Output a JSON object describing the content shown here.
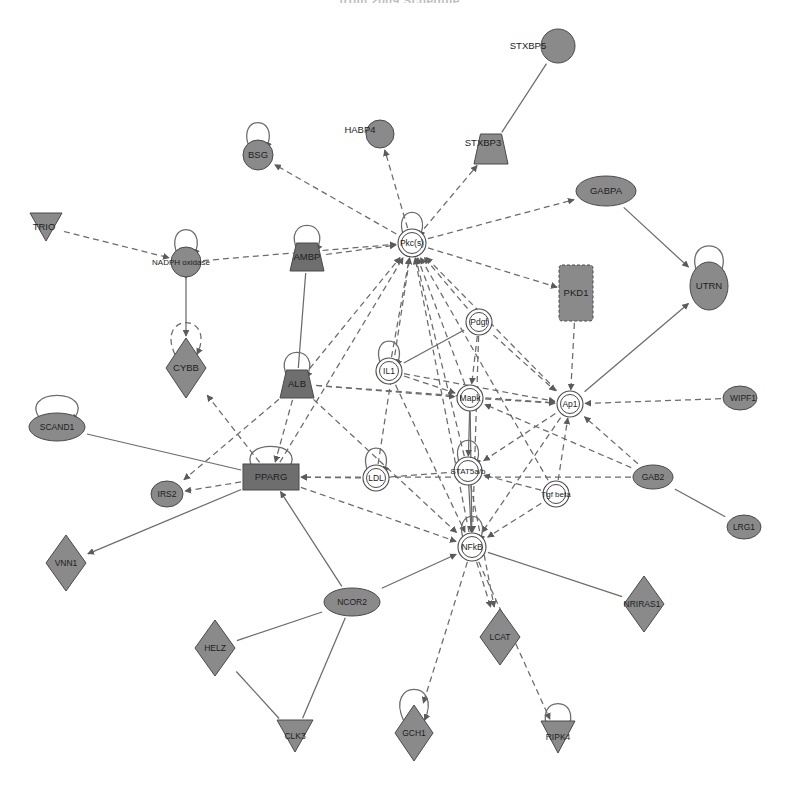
{
  "title": "from 2009 Schedule",
  "canvas": {
    "width": 799,
    "height": 786,
    "background": "#ffffff"
  },
  "style": {
    "node_fill_gray": "#8a8a8a",
    "node_fill_dark": "#6e6e6e",
    "node_fill_white": "#ffffff",
    "node_stroke": "#4a4a4a",
    "edge_color": "#6b6b6b",
    "label_color": "#1d1d1d"
  },
  "legend_shapes": {
    "ellipse": "transcription-regulator",
    "circle": "other",
    "diamond": "enzyme",
    "triangle-down": "kinase-phosphatase",
    "rectangle": "ligand-dependent-nuclear-receptor",
    "trapezoid": "transporter",
    "double-circle": "group-complex",
    "vertical-rectangle": "kinase"
  },
  "nodes": [
    {
      "id": "STXBP5",
      "label": "STXBP5",
      "x": 558,
      "y": 46,
      "shape": "circle",
      "rx": 17,
      "ry": 16,
      "fill": "gray",
      "selfloop": false,
      "label_dx": -30,
      "label_dy": 0
    },
    {
      "id": "HABP4",
      "label": "HABP4",
      "x": 380,
      "y": 134,
      "shape": "circle",
      "rx": 14,
      "ry": 14,
      "fill": "gray",
      "selfloop": false,
      "label_dx": -20,
      "label_dy": -4
    },
    {
      "id": "BSG",
      "label": "BSG",
      "x": 258,
      "y": 155,
      "shape": "circle",
      "rx": 15,
      "ry": 15,
      "fill": "gray",
      "selfloop": true,
      "label_dx": 0,
      "label_dy": 0
    },
    {
      "id": "STXBP3",
      "label": "STXBP3",
      "x": 491,
      "y": 149,
      "shape": "trapezoid",
      "rx": 17,
      "ry": 15,
      "fill": "gray",
      "selfloop": false,
      "label_dx": -8,
      "label_dy": -6
    },
    {
      "id": "GABPA",
      "label": "GABPA",
      "x": 606,
      "y": 191,
      "shape": "ellipse",
      "rx": 30,
      "ry": 15,
      "fill": "gray",
      "selfloop": false,
      "label_dx": 0,
      "label_dy": 0
    },
    {
      "id": "TRIO",
      "label": "TRIO",
      "x": 46,
      "y": 227,
      "shape": "triangle-down",
      "rx": 16,
      "ry": 14,
      "fill": "gray",
      "selfloop": false,
      "label_dx": -2,
      "label_dy": 0
    },
    {
      "id": "NADPH",
      "label": "NADPH oxidase",
      "x": 186,
      "y": 262,
      "shape": "circle",
      "rx": 15,
      "ry": 15,
      "fill": "gray",
      "selfloop": true,
      "label_dx": -5,
      "label_dy": 0,
      "label_class": "xs"
    },
    {
      "id": "AMBP",
      "label": "AMBP",
      "x": 307,
      "y": 257,
      "shape": "trapezoid",
      "rx": 17,
      "ry": 14,
      "fill": "dark",
      "selfloop": true,
      "label_dx": 0,
      "label_dy": 0
    },
    {
      "id": "PKCS",
      "label": "Pkc(s)",
      "x": 412,
      "y": 243,
      "shape": "double-circle",
      "rx": 14,
      "ry": 13,
      "fill": "white",
      "selfloop": true,
      "label_dx": 0,
      "label_dy": 0,
      "label_class": "sm"
    },
    {
      "id": "PKD1",
      "label": "PKD1",
      "x": 576,
      "y": 293,
      "shape": "vertical-rectangle",
      "rx": 17,
      "ry": 28,
      "fill": "gray",
      "selfloop": false,
      "label_dx": 0,
      "label_dy": 0
    },
    {
      "id": "UTRN",
      "label": "UTRN",
      "x": 709,
      "y": 286,
      "shape": "ellipse",
      "rx": 19,
      "ry": 24,
      "fill": "gray",
      "selfloop": true,
      "label_dx": 0,
      "label_dy": 0
    },
    {
      "id": "CYBB",
      "label": "CYBB",
      "x": 186,
      "y": 368,
      "shape": "diamond",
      "rx": 20,
      "ry": 30,
      "fill": "gray",
      "selfloop": true,
      "selfloop_dashed": true,
      "label_dx": 0,
      "label_dy": 0
    },
    {
      "id": "PDGF",
      "label": "Pdgf",
      "x": 479,
      "y": 322,
      "shape": "double-circle",
      "rx": 13,
      "ry": 12,
      "fill": "white",
      "selfloop": false,
      "label_dx": 0,
      "label_dy": 0,
      "label_class": "sm"
    },
    {
      "id": "IL1",
      "label": "IL1",
      "x": 389,
      "y": 371,
      "shape": "double-circle",
      "rx": 13,
      "ry": 12,
      "fill": "white",
      "selfloop": true,
      "label_dx": 0,
      "label_dy": 0,
      "label_class": "sm"
    },
    {
      "id": "ALB",
      "label": "ALB",
      "x": 297,
      "y": 384,
      "shape": "trapezoid",
      "rx": 17,
      "ry": 14,
      "fill": "dark",
      "selfloop": true,
      "label_dx": 0,
      "label_dy": 0
    },
    {
      "id": "MAPK",
      "label": "Mapk",
      "x": 470,
      "y": 398,
      "shape": "double-circle",
      "rx": 13,
      "ry": 12,
      "fill": "white",
      "selfloop": false,
      "label_dx": 0,
      "label_dy": 0,
      "label_class": "sm"
    },
    {
      "id": "AP1",
      "label": "Ap1",
      "x": 570,
      "y": 404,
      "shape": "double-circle",
      "rx": 13,
      "ry": 12,
      "fill": "white",
      "selfloop": false,
      "label_dx": 0,
      "label_dy": 0,
      "label_class": "sm"
    },
    {
      "id": "WIPF1",
      "label": "WIPF1",
      "x": 740,
      "y": 398,
      "shape": "ellipse",
      "rx": 17,
      "ry": 12,
      "fill": "gray",
      "selfloop": false,
      "label_dx": 3,
      "label_dy": 0,
      "label_class": "sm"
    },
    {
      "id": "SCAND1",
      "label": "SCAND1",
      "x": 57,
      "y": 427,
      "shape": "ellipse",
      "rx": 28,
      "ry": 14,
      "fill": "gray",
      "selfloop": true,
      "label_dx": 0,
      "label_dy": 0,
      "label_class": "sm"
    },
    {
      "id": "PPARG",
      "label": "PPARG",
      "x": 271,
      "y": 477,
      "shape": "rectangle",
      "rx": 28,
      "ry": 13,
      "fill": "dark",
      "selfloop": true,
      "label_dx": 0,
      "label_dy": 0
    },
    {
      "id": "LDL",
      "label": "LDL",
      "x": 376,
      "y": 478,
      "shape": "double-circle",
      "rx": 13,
      "ry": 12,
      "fill": "white",
      "selfloop": true,
      "label_dx": 0,
      "label_dy": 0,
      "label_class": "sm"
    },
    {
      "id": "STAT5",
      "label": "STAT5a/b",
      "x": 468,
      "y": 471,
      "shape": "double-circle",
      "rx": 14,
      "ry": 13,
      "fill": "white",
      "selfloop": true,
      "label_dx": 0,
      "label_dy": 0,
      "label_class": "xs"
    },
    {
      "id": "TGFB",
      "label": "Tgf beta",
      "x": 556,
      "y": 494,
      "shape": "double-circle",
      "rx": 13,
      "ry": 12,
      "fill": "white",
      "selfloop": false,
      "label_dx": 0,
      "label_dy": 0,
      "label_class": "xs"
    },
    {
      "id": "GAB2",
      "label": "GAB2",
      "x": 653,
      "y": 477,
      "shape": "ellipse",
      "rx": 20,
      "ry": 12,
      "fill": "gray",
      "selfloop": false,
      "label_dx": 0,
      "label_dy": 0,
      "label_class": "sm"
    },
    {
      "id": "IRS2",
      "label": "IRS2",
      "x": 167,
      "y": 494,
      "shape": "ellipse",
      "rx": 16,
      "ry": 13,
      "fill": "gray",
      "selfloop": false,
      "label_dx": 0,
      "label_dy": 0,
      "label_class": "sm"
    },
    {
      "id": "LRG1",
      "label": "LRG1",
      "x": 744,
      "y": 527,
      "shape": "ellipse",
      "rx": 17,
      "ry": 12,
      "fill": "gray",
      "selfloop": false,
      "label_dx": 0,
      "label_dy": 0,
      "label_class": "sm"
    },
    {
      "id": "NFKB",
      "label": "NFkB",
      "x": 472,
      "y": 547,
      "shape": "double-circle",
      "rx": 14,
      "ry": 13,
      "fill": "white",
      "selfloop": true,
      "label_dx": 0,
      "label_dy": 0,
      "label_class": "sm"
    },
    {
      "id": "VNN1",
      "label": "VNN1",
      "x": 66,
      "y": 563,
      "shape": "diamond",
      "rx": 20,
      "ry": 28,
      "fill": "gray",
      "selfloop": false,
      "label_dx": 0,
      "label_dy": 0,
      "label_class": "sm"
    },
    {
      "id": "NCOR2",
      "label": "NCOR2",
      "x": 352,
      "y": 602,
      "shape": "ellipse",
      "rx": 28,
      "ry": 14,
      "fill": "gray",
      "selfloop": false,
      "label_dx": 0,
      "label_dy": 0,
      "label_class": "sm"
    },
    {
      "id": "NRIRAS1",
      "label": "NRIRAS1",
      "x": 644,
      "y": 604,
      "shape": "diamond",
      "rx": 20,
      "ry": 28,
      "fill": "gray",
      "selfloop": false,
      "label_dx": -2,
      "label_dy": 0,
      "label_class": "sm"
    },
    {
      "id": "HELZ",
      "label": "HELZ",
      "x": 215,
      "y": 648,
      "shape": "diamond",
      "rx": 20,
      "ry": 28,
      "fill": "gray",
      "selfloop": false,
      "label_dx": 0,
      "label_dy": 0,
      "label_class": "sm"
    },
    {
      "id": "LCAT",
      "label": "LCAT",
      "x": 500,
      "y": 637,
      "shape": "diamond",
      "rx": 20,
      "ry": 28,
      "fill": "gray",
      "selfloop": false,
      "label_dx": 0,
      "label_dy": 0,
      "label_class": "sm"
    },
    {
      "id": "CLK3",
      "label": "CLK3",
      "x": 295,
      "y": 736,
      "shape": "triangle-down",
      "rx": 18,
      "ry": 16,
      "fill": "gray",
      "selfloop": false,
      "label_dx": 0,
      "label_dy": 0,
      "label_class": "sm"
    },
    {
      "id": "GCH1",
      "label": "GCH1",
      "x": 414,
      "y": 733,
      "shape": "diamond",
      "rx": 19,
      "ry": 28,
      "fill": "gray",
      "selfloop": true,
      "label_dx": 0,
      "label_dy": 0,
      "label_class": "sm"
    },
    {
      "id": "RIPK4",
      "label": "RIPK4",
      "x": 558,
      "y": 737,
      "shape": "triangle-down",
      "rx": 17,
      "ry": 16,
      "fill": "gray",
      "selfloop": true,
      "label_dx": 0,
      "label_dy": 0,
      "label_class": "sm"
    }
  ],
  "edges": [
    {
      "from": "STXBP3",
      "to": "STXBP5",
      "style": "solid",
      "arrow": "none"
    },
    {
      "from": "PKCS",
      "to": "BSG",
      "style": "dashed",
      "arrow": "to"
    },
    {
      "from": "PKCS",
      "to": "HABP4",
      "style": "dashed",
      "arrow": "to"
    },
    {
      "from": "PKCS",
      "to": "STXBP3",
      "style": "dashed",
      "arrow": "to"
    },
    {
      "from": "PKCS",
      "to": "GABPA",
      "style": "dashed",
      "arrow": "to"
    },
    {
      "from": "TRIO",
      "to": "NADPH",
      "style": "dashed",
      "arrow": "to"
    },
    {
      "from": "NADPH",
      "to": "PKCS",
      "style": "dashed",
      "arrow": "to"
    },
    {
      "from": "AMBP",
      "to": "PKCS",
      "style": "dashed",
      "arrow": "to"
    },
    {
      "from": "NADPH",
      "to": "CYBB",
      "style": "solid",
      "arrow": "both"
    },
    {
      "from": "AMBP",
      "to": "ALB",
      "style": "solid",
      "arrow": "none"
    },
    {
      "from": "GABPA",
      "to": "UTRN",
      "style": "solid",
      "arrow": "to"
    },
    {
      "from": "AP1",
      "to": "UTRN",
      "style": "solid",
      "arrow": "to"
    },
    {
      "from": "PKD1",
      "to": "AP1",
      "style": "dashed",
      "arrow": "to"
    },
    {
      "from": "PKCS",
      "to": "PKD1",
      "style": "dashed",
      "arrow": "to"
    },
    {
      "from": "PDGF",
      "to": "PKCS",
      "style": "dashed",
      "arrow": "to"
    },
    {
      "from": "IL1",
      "to": "PKCS",
      "style": "dashed",
      "arrow": "to"
    },
    {
      "from": "ALB",
      "to": "PKCS",
      "style": "dashed",
      "arrow": "to"
    },
    {
      "from": "MAPK",
      "to": "PKCS",
      "style": "dashed",
      "arrow": "to"
    },
    {
      "from": "AP1",
      "to": "PKCS",
      "style": "dashed",
      "arrow": "to"
    },
    {
      "from": "STAT5",
      "to": "PKCS",
      "style": "dashed",
      "arrow": "to"
    },
    {
      "from": "NFKB",
      "to": "PKCS",
      "style": "dashed",
      "arrow": "to"
    },
    {
      "from": "LDL",
      "to": "PKCS",
      "style": "dashed",
      "arrow": "to"
    },
    {
      "from": "TGFB",
      "to": "PKCS",
      "style": "dashed",
      "arrow": "to"
    },
    {
      "from": "PPARG",
      "to": "PKCS",
      "style": "dashed",
      "arrow": "to"
    },
    {
      "from": "PDGF",
      "to": "MAPK",
      "style": "dashed",
      "arrow": "to"
    },
    {
      "from": "PDGF",
      "to": "AP1",
      "style": "dashed",
      "arrow": "to"
    },
    {
      "from": "PDGF",
      "to": "IL1",
      "style": "solid",
      "arrow": "none"
    },
    {
      "from": "PDGF",
      "to": "NFKB",
      "style": "dashed",
      "arrow": "to"
    },
    {
      "from": "IL1",
      "to": "MAPK",
      "style": "dashed",
      "arrow": "to"
    },
    {
      "from": "IL1",
      "to": "NFKB",
      "style": "dashed",
      "arrow": "to"
    },
    {
      "from": "IL1",
      "to": "AP1",
      "style": "dashed",
      "arrow": "to"
    },
    {
      "from": "MAPK",
      "to": "AP1",
      "style": "dashed",
      "arrow": "to"
    },
    {
      "from": "MAPK",
      "to": "NFKB",
      "style": "solid",
      "arrow": "to"
    },
    {
      "from": "MAPK",
      "to": "STAT5",
      "style": "solid",
      "arrow": "both"
    },
    {
      "from": "STAT5",
      "to": "NFKB",
      "style": "solid",
      "arrow": "both"
    },
    {
      "from": "WIPF1",
      "to": "AP1",
      "style": "dashed",
      "arrow": "to"
    },
    {
      "from": "GAB2",
      "to": "AP1",
      "style": "dashed",
      "arrow": "to"
    },
    {
      "from": "GAB2",
      "to": "MAPK",
      "style": "dashed",
      "arrow": "to"
    },
    {
      "from": "GAB2",
      "to": "PPARG",
      "style": "dashed",
      "arrow": "to"
    },
    {
      "from": "TGFB",
      "to": "AP1",
      "style": "dashed",
      "arrow": "to"
    },
    {
      "from": "TGFB",
      "to": "STAT5",
      "style": "dashed",
      "arrow": "to"
    },
    {
      "from": "TGFB",
      "to": "NFKB",
      "style": "dashed",
      "arrow": "to"
    },
    {
      "from": "LDL",
      "to": "PPARG",
      "style": "dashed",
      "arrow": "to"
    },
    {
      "from": "LDL",
      "to": "STAT5",
      "style": "dashed",
      "arrow": "none"
    },
    {
      "from": "SCAND1",
      "to": "PPARG",
      "style": "solid",
      "arrow": "none"
    },
    {
      "from": "PPARG",
      "to": "IRS2",
      "style": "dashed",
      "arrow": "to"
    },
    {
      "from": "PPARG",
      "to": "VNN1",
      "style": "solid",
      "arrow": "to"
    },
    {
      "from": "PPARG",
      "to": "CYBB",
      "style": "dashed",
      "arrow": "to"
    },
    {
      "from": "ALB",
      "to": "PPARG",
      "style": "dashed",
      "arrow": "to"
    },
    {
      "from": "ALB",
      "to": "IRS2",
      "style": "dashed",
      "arrow": "to"
    },
    {
      "from": "NCOR2",
      "to": "PPARG",
      "style": "solid",
      "arrow": "to"
    },
    {
      "from": "NCOR2",
      "to": "NFKB",
      "style": "solid",
      "arrow": "to"
    },
    {
      "from": "NCOR2",
      "to": "HELZ",
      "style": "solid",
      "arrow": "none"
    },
    {
      "from": "NCOR2",
      "to": "CLK3",
      "style": "solid",
      "arrow": "none"
    },
    {
      "from": "HELZ",
      "to": "CLK3",
      "style": "solid",
      "arrow": "none"
    },
    {
      "from": "NFKB",
      "to": "LCAT",
      "style": "dashed",
      "arrow": "to"
    },
    {
      "from": "NFKB",
      "to": "GCH1",
      "style": "dashed",
      "arrow": "to"
    },
    {
      "from": "NFKB",
      "to": "RIPK4",
      "style": "dashed",
      "arrow": "to"
    },
    {
      "from": "NFKB",
      "to": "NRIRAS1",
      "style": "solid",
      "arrow": "none"
    },
    {
      "from": "STAT5",
      "to": "LCAT",
      "style": "dashed",
      "arrow": "to"
    },
    {
      "from": "PPARG",
      "to": "NFKB",
      "style": "dashed",
      "arrow": "to"
    },
    {
      "from": "LRG1",
      "to": "GAB2",
      "style": "solid",
      "arrow": "none"
    },
    {
      "from": "AP1",
      "to": "NFKB",
      "style": "dashed",
      "arrow": "to"
    },
    {
      "from": "AP1",
      "to": "STAT5",
      "style": "dashed",
      "arrow": "to"
    },
    {
      "from": "ALB",
      "to": "NFKB",
      "style": "dashed",
      "arrow": "to"
    },
    {
      "from": "ALB",
      "to": "AP1",
      "style": "dashed",
      "arrow": "to"
    },
    {
      "from": "ALB",
      "to": "MAPK",
      "style": "dashed",
      "arrow": "to"
    }
  ]
}
